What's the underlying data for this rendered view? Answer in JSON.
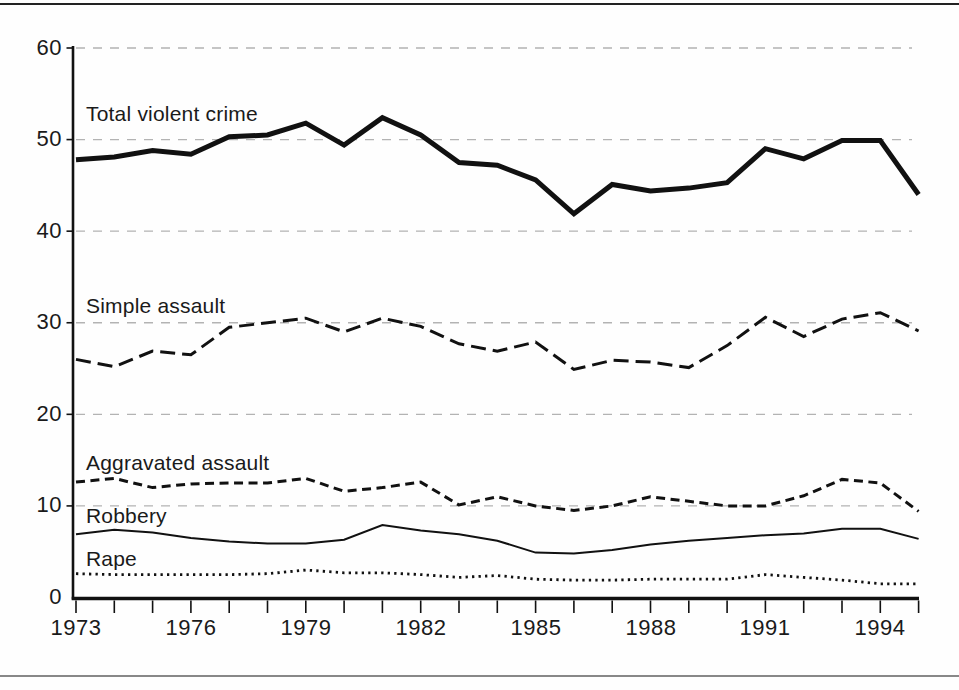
{
  "figure": {
    "type": "scanned-book-figure",
    "background": "#fefefe",
    "line_color": "#111111",
    "grid_color": "#b3b3b3"
  },
  "chart_data": {
    "type": "line",
    "title": "",
    "xlabel": "",
    "ylabel": "",
    "ylim": [
      0,
      60
    ],
    "grid": "horizontal-dashed",
    "legend_position": "inline-labels-left",
    "yticks": [
      "60",
      "50",
      "40",
      "30",
      "20",
      "10",
      "0"
    ],
    "x_labeled": [
      "1973",
      "1976",
      "1979",
      "1982",
      "1985",
      "1988",
      "1991",
      "1994"
    ],
    "x": [
      1973,
      1974,
      1975,
      1976,
      1977,
      1978,
      1979,
      1980,
      1981,
      1982,
      1983,
      1984,
      1985,
      1986,
      1987,
      1988,
      1989,
      1990,
      1991,
      1992,
      1993,
      1994,
      1995
    ],
    "series": [
      {
        "name": "Total violent crime",
        "style": {
          "stroke_width": 5,
          "dash": "solid"
        },
        "values": [
          47.8,
          48.1,
          48.8,
          48.4,
          50.3,
          50.5,
          51.8,
          49.4,
          52.4,
          50.5,
          47.5,
          47.2,
          45.6,
          41.9,
          45.1,
          44.4,
          44.7,
          45.3,
          49.0,
          47.9,
          49.9,
          49.9,
          44.0
        ]
      },
      {
        "name": "Simple assault",
        "style": {
          "stroke_width": 3,
          "dash": "15 7"
        },
        "values": [
          26.0,
          25.2,
          26.9,
          26.5,
          29.5,
          30.0,
          30.5,
          29.0,
          30.5,
          29.6,
          27.7,
          26.9,
          27.9,
          24.9,
          25.9,
          25.7,
          25.1,
          27.5,
          30.6,
          28.5,
          30.4,
          31.1,
          29.1
        ]
      },
      {
        "name": "Aggravated assault",
        "style": {
          "stroke_width": 3,
          "dash": "9 5.5"
        },
        "values": [
          12.6,
          13.0,
          12.0,
          12.4,
          12.5,
          12.5,
          13.0,
          11.6,
          12.0,
          12.6,
          10.1,
          11.0,
          10.0,
          9.5,
          10.0,
          11.0,
          10.5,
          10.0,
          10.0,
          11.1,
          12.9,
          12.5,
          9.4
        ]
      },
      {
        "name": "Robbery",
        "style": {
          "stroke_width": 2,
          "dash": "solid"
        },
        "values": [
          6.9,
          7.4,
          7.1,
          6.5,
          6.1,
          5.9,
          5.9,
          6.3,
          7.9,
          7.3,
          6.9,
          6.2,
          4.9,
          4.8,
          5.2,
          5.8,
          6.2,
          6.5,
          6.8,
          7.0,
          7.5,
          7.5,
          6.4
        ]
      },
      {
        "name": "Rape",
        "style": {
          "stroke_width": 2.8,
          "dash": "2.3 4.2"
        },
        "values": [
          2.6,
          2.5,
          2.5,
          2.5,
          2.5,
          2.6,
          3.0,
          2.7,
          2.7,
          2.5,
          2.2,
          2.4,
          2.0,
          1.9,
          1.9,
          2.0,
          2.0,
          2.0,
          2.5,
          2.2,
          1.9,
          1.5,
          1.5
        ]
      }
    ]
  }
}
